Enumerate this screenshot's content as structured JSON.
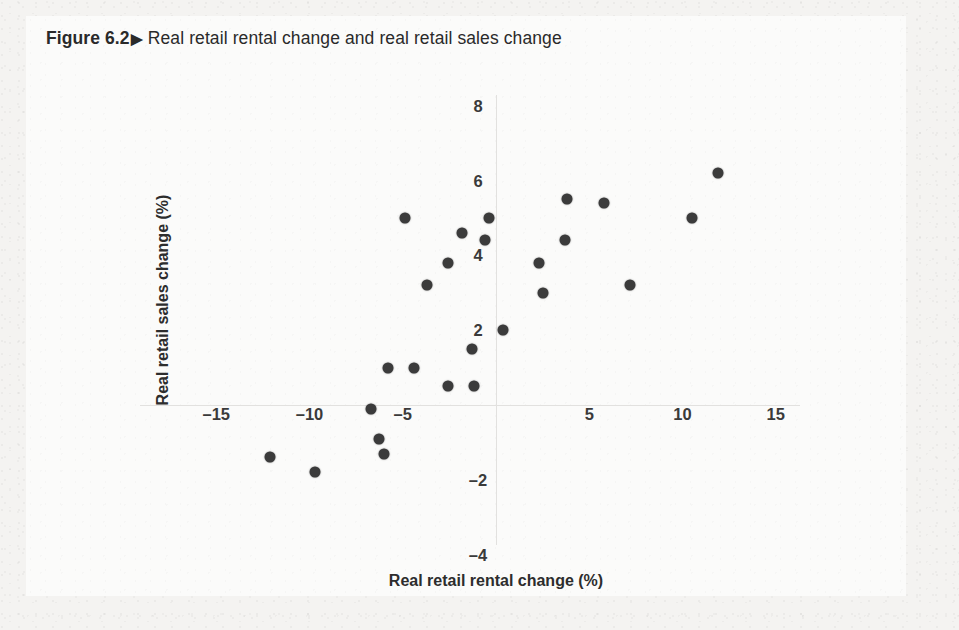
{
  "figure": {
    "label": "Figure 6.2",
    "arrow_icon": "triangle-right-icon",
    "arrow_glyph": "▶",
    "caption": "Real retail rental change and real retail sales change"
  },
  "colors": {
    "page_background": "#f4f3f1",
    "card_background": "#fbfbfa",
    "point": "#3b3b3b",
    "axis": "#e2e1df",
    "text": "#2d2d2d"
  },
  "chart_data": {
    "type": "scatter",
    "title": "Real retail rental change and real retail sales change",
    "xlabel": "Real retail rental change (%)",
    "ylabel": "Real retail sales change (%)",
    "xlim": [
      -18,
      16.5
    ],
    "ylim": [
      -4.8,
      8.8
    ],
    "xticks": [
      -15,
      -10,
      -5,
      5,
      10,
      15
    ],
    "xtick_labels": [
      "–15",
      "–10",
      "–5",
      "5",
      "10",
      "15"
    ],
    "yticks": [
      8,
      6,
      4,
      2,
      -2,
      -4
    ],
    "ytick_labels": [
      "8",
      "6",
      "4",
      "2",
      "–2",
      "–4"
    ],
    "grid": false,
    "legend": false,
    "axes_style": "zero-crossing-spines",
    "marker": "filled-circle",
    "n_points": 25,
    "points": [
      {
        "x": -12.1,
        "y": -1.4
      },
      {
        "x": -9.7,
        "y": -1.8
      },
      {
        "x": -6.7,
        "y": -0.1
      },
      {
        "x": -6.3,
        "y": -0.9
      },
      {
        "x": -6.0,
        "y": -1.3
      },
      {
        "x": -5.8,
        "y": 1.0
      },
      {
        "x": -4.4,
        "y": 1.0
      },
      {
        "x": -4.9,
        "y": 5.0
      },
      {
        "x": -2.6,
        "y": 0.5
      },
      {
        "x": -1.2,
        "y": 0.5
      },
      {
        "x": -3.7,
        "y": 3.2
      },
      {
        "x": -2.6,
        "y": 3.8
      },
      {
        "x": -1.8,
        "y": 4.6
      },
      {
        "x": -0.6,
        "y": 4.4
      },
      {
        "x": -0.4,
        "y": 5.0
      },
      {
        "x": -1.3,
        "y": 1.5
      },
      {
        "x": 0.4,
        "y": 2.0
      },
      {
        "x": 2.5,
        "y": 3.0
      },
      {
        "x": 2.3,
        "y": 3.8
      },
      {
        "x": 3.7,
        "y": 4.4
      },
      {
        "x": 3.8,
        "y": 5.5
      },
      {
        "x": 5.8,
        "y": 5.4
      },
      {
        "x": 7.2,
        "y": 3.2
      },
      {
        "x": 10.5,
        "y": 5.0
      },
      {
        "x": 11.9,
        "y": 6.2
      }
    ]
  }
}
